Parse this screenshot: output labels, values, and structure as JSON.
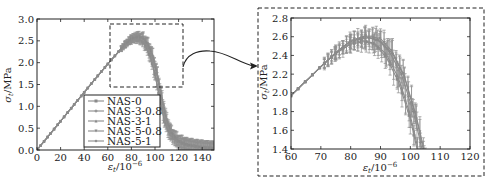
{
  "chart_data": [
    {
      "type": "line",
      "panel": "main",
      "title": "",
      "xlabel": "ε_t/10^-6",
      "ylabel": "σ_t/MPa",
      "xlim": [
        0,
        150
      ],
      "ylim": [
        0,
        3.0
      ],
      "xticks": [
        0,
        20,
        40,
        60,
        80,
        100,
        120,
        140
      ],
      "yticks": [
        0.0,
        0.5,
        1.0,
        1.5,
        2.0,
        2.5,
        3.0
      ],
      "grid": false,
      "legend_position": "lower center",
      "error_bars": true,
      "zoom_box": {
        "x": [
          61,
          122
        ],
        "y": [
          1.45,
          2.85
        ]
      },
      "series": [
        {
          "name": "NAS-0",
          "marker": "square",
          "x": [
            0,
            10,
            20,
            30,
            40,
            50,
            60,
            70,
            75,
            80,
            84,
            88,
            92,
            96,
            100,
            104,
            108,
            112,
            118,
            125,
            135,
            145,
            150
          ],
          "y": [
            0,
            0.33,
            0.66,
            0.99,
            1.32,
            1.65,
            1.97,
            2.28,
            2.42,
            2.53,
            2.56,
            2.52,
            2.38,
            2.12,
            1.72,
            1.15,
            0.65,
            0.38,
            0.2,
            0.12,
            0.07,
            0.05,
            0.04
          ]
        },
        {
          "name": "NAS-3-0.8",
          "marker": "plus",
          "x": [
            0,
            10,
            20,
            30,
            40,
            50,
            60,
            70,
            75,
            80,
            85,
            89,
            93,
            97,
            101,
            105,
            109,
            113,
            119,
            126,
            136,
            146,
            150
          ],
          "y": [
            0,
            0.33,
            0.66,
            0.99,
            1.32,
            1.65,
            1.97,
            2.28,
            2.43,
            2.55,
            2.6,
            2.57,
            2.44,
            2.2,
            1.8,
            1.25,
            0.72,
            0.42,
            0.22,
            0.13,
            0.08,
            0.05,
            0.04
          ]
        },
        {
          "name": "NAS-3-1",
          "marker": "triangle-up",
          "x": [
            0,
            10,
            20,
            30,
            40,
            50,
            60,
            70,
            75,
            80,
            85,
            88,
            92,
            96,
            100,
            104,
            108,
            112,
            118,
            125,
            135,
            145,
            150
          ],
          "y": [
            0,
            0.33,
            0.66,
            0.99,
            1.32,
            1.65,
            1.97,
            2.28,
            2.42,
            2.52,
            2.55,
            2.53,
            2.41,
            2.16,
            1.76,
            1.2,
            0.68,
            0.4,
            0.21,
            0.12,
            0.07,
            0.05,
            0.04
          ]
        },
        {
          "name": "NAS-5-0.8",
          "marker": "triangle-down",
          "x": [
            0,
            10,
            20,
            30,
            40,
            50,
            60,
            70,
            75,
            80,
            85,
            90,
            94,
            98,
            102,
            106,
            110,
            114,
            120,
            127,
            137,
            147,
            150
          ],
          "y": [
            0,
            0.33,
            0.66,
            0.99,
            1.32,
            1.65,
            1.97,
            2.28,
            2.43,
            2.56,
            2.61,
            2.58,
            2.44,
            2.18,
            1.75,
            1.2,
            0.7,
            0.41,
            0.22,
            0.13,
            0.08,
            0.05,
            0.04
          ]
        },
        {
          "name": "NAS-5-1",
          "marker": "diamond",
          "x": [
            0,
            10,
            20,
            30,
            40,
            50,
            60,
            70,
            75,
            80,
            86,
            90,
            94,
            98,
            102,
            106,
            110,
            114,
            120,
            127,
            137,
            147,
            150
          ],
          "y": [
            0,
            0.33,
            0.66,
            0.99,
            1.32,
            1.65,
            1.97,
            2.28,
            2.43,
            2.55,
            2.59,
            2.55,
            2.42,
            2.17,
            1.73,
            1.15,
            0.66,
            0.39,
            0.2,
            0.12,
            0.07,
            0.05,
            0.04
          ]
        }
      ]
    },
    {
      "type": "line",
      "panel": "zoom",
      "title": "",
      "xlabel": "ε_t/10^-6",
      "ylabel": "σ_t/MPa",
      "xlim": [
        60,
        120
      ],
      "ylim": [
        1.4,
        2.8
      ],
      "xticks": [
        60,
        70,
        80,
        90,
        100,
        110,
        120
      ],
      "yticks": [
        1.4,
        1.6,
        1.8,
        2.0,
        2.2,
        2.4,
        2.6,
        2.8
      ],
      "grid": false,
      "error_bars": true,
      "note": "Magnified view of the dashed region of the main plot"
    }
  ],
  "main": {
    "legend": [
      "NAS-0",
      "NAS-3-0.8",
      "NAS-3-1",
      "NAS-5-0.8",
      "NAS-5-1"
    ],
    "xlabel": "εt/10⁻⁶",
    "ylabel": "σt/MPa",
    "xtick_labels": [
      "0",
      "20",
      "40",
      "60",
      "80",
      "100",
      "120",
      "140"
    ],
    "ytick_labels": [
      "0.0",
      "0.5",
      "1.0",
      "1.5",
      "2.0",
      "2.5",
      "3.0"
    ]
  },
  "zoom": {
    "xlabel": "εt/10⁻⁶",
    "ylabel": "σt/MPa",
    "xtick_labels": [
      "60",
      "70",
      "80",
      "90",
      "100",
      "110",
      "120"
    ],
    "ytick_labels": [
      "1.4",
      "1.6",
      "1.8",
      "2.0",
      "2.2",
      "2.4",
      "2.6",
      "2.8"
    ]
  },
  "colors": {
    "series": "#8a8a8a",
    "errorbar": "#8f8f8f",
    "axis": "#222222",
    "dashed_box": "#222222"
  }
}
